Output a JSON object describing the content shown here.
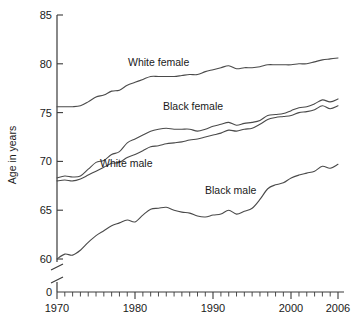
{
  "chart_data": {
    "type": "line",
    "title": "",
    "subtitle": "",
    "xlabel": "",
    "ylabel": "Age in years",
    "xlim": [
      1970,
      2006
    ],
    "ylim": [
      60,
      85
    ],
    "grid": false,
    "legend_position": "inline-labels",
    "y_axis_break": true,
    "y_axis_break_note": "axis broken between 0 and 60",
    "y_zero_label": "0",
    "x_ticks": [
      1970,
      1980,
      1990,
      2000,
      2006
    ],
    "x_tick_labels": [
      "1970",
      "1980",
      "1990",
      "2000",
      "2006"
    ],
    "x_minor_tick_interval": 1,
    "y_ticks": [
      60,
      65,
      70,
      75,
      80,
      85
    ],
    "y_tick_labels": [
      "60",
      "65",
      "70",
      "75",
      "80",
      "85"
    ],
    "x": [
      1970,
      1971,
      1972,
      1973,
      1974,
      1975,
      1976,
      1977,
      1978,
      1979,
      1980,
      1981,
      1982,
      1983,
      1984,
      1985,
      1986,
      1987,
      1988,
      1989,
      1990,
      1991,
      1992,
      1993,
      1994,
      1995,
      1996,
      1997,
      1998,
      1999,
      2000,
      2001,
      2002,
      2003,
      2004,
      2005,
      2006
    ],
    "series": [
      {
        "name": "White female",
        "label": "White female",
        "color": "#4a4a4a",
        "values": [
          75.6,
          75.6,
          75.6,
          75.7,
          76.1,
          76.6,
          76.8,
          77.2,
          77.3,
          77.8,
          78.1,
          78.4,
          78.7,
          78.7,
          78.7,
          78.7,
          78.8,
          78.9,
          78.9,
          79.2,
          79.4,
          79.6,
          79.8,
          79.5,
          79.6,
          79.6,
          79.7,
          79.9,
          79.9,
          79.9,
          79.9,
          80.0,
          80.0,
          80.2,
          80.4,
          80.5,
          80.6
        ]
      },
      {
        "name": "Black female",
        "label": "Black female",
        "color": "#4a4a4a",
        "values": [
          68.3,
          68.5,
          68.4,
          68.5,
          69.2,
          69.9,
          70.1,
          70.7,
          71.0,
          71.9,
          72.3,
          72.7,
          73.1,
          73.3,
          73.4,
          73.3,
          73.3,
          73.3,
          73.1,
          73.3,
          73.6,
          73.8,
          74.0,
          73.7,
          73.9,
          74.0,
          74.2,
          74.7,
          74.8,
          74.9,
          75.2,
          75.5,
          75.6,
          75.9,
          76.3,
          76.1,
          76.4
        ]
      },
      {
        "name": "White male",
        "label": "White male",
        "color": "#4a4a4a",
        "values": [
          68.0,
          68.1,
          68.0,
          68.2,
          68.6,
          69.0,
          69.4,
          69.8,
          69.9,
          70.4,
          70.7,
          71.1,
          71.5,
          71.6,
          71.8,
          71.9,
          72.0,
          72.2,
          72.3,
          72.5,
          72.7,
          72.9,
          73.2,
          73.1,
          73.3,
          73.4,
          73.8,
          74.3,
          74.5,
          74.6,
          74.7,
          75.0,
          75.1,
          75.3,
          75.7,
          75.4,
          75.7
        ]
      },
      {
        "name": "Black male",
        "label": "Black male",
        "color": "#4a4a4a",
        "values": [
          60.0,
          60.5,
          60.4,
          60.9,
          61.7,
          62.4,
          62.9,
          63.4,
          63.7,
          64.0,
          63.8,
          64.5,
          65.1,
          65.2,
          65.3,
          65.0,
          64.8,
          64.7,
          64.4,
          64.3,
          64.5,
          64.6,
          65.0,
          64.6,
          64.9,
          65.2,
          66.1,
          67.2,
          67.6,
          67.8,
          68.3,
          68.6,
          68.8,
          69.0,
          69.5,
          69.3,
          69.7
        ]
      }
    ]
  },
  "axis": {
    "y_title": "Age in years",
    "zero_label": "0"
  },
  "labels": {
    "white_female": "White female",
    "black_female": "Black female",
    "white_male": "White male",
    "black_male": "Black male"
  },
  "x_tick_text": {
    "t1970": "1970",
    "t1980": "1980",
    "t1990": "1990",
    "t2000": "2000",
    "t2006": "2006"
  },
  "y_tick_text": {
    "t60": "60",
    "t65": "65",
    "t70": "70",
    "t75": "75",
    "t80": "80",
    "t85": "85"
  }
}
